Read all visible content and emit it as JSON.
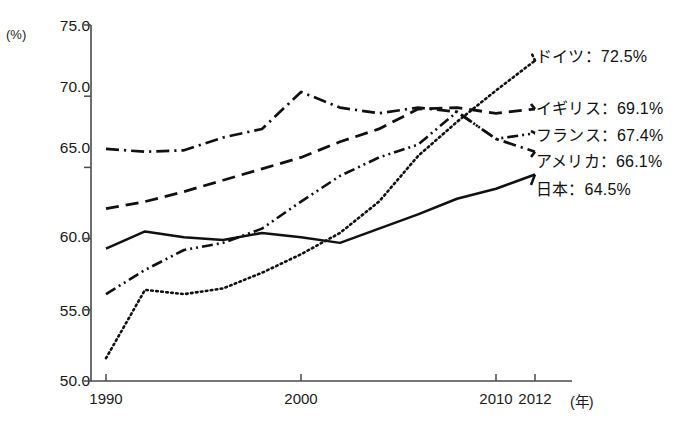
{
  "chart_data": {
    "type": "line",
    "title": "",
    "subtitle": "",
    "xlabel": "(年)",
    "ylabel": "(%)",
    "xlim": [
      1990,
      2012
    ],
    "ylim": [
      50.0,
      75.0
    ],
    "grid": false,
    "legend_position": "right-inline-end-of-line",
    "x_tick_labels": [
      "1990",
      "2000",
      "2010",
      "2012"
    ],
    "x_ticks": [
      1990,
      2000,
      2010,
      2012
    ],
    "y_tick_labels": [
      "75.0",
      "70.0",
      "65.0",
      "60.0",
      "55.0",
      "50.0"
    ],
    "y_ticks": [
      75.0,
      70.0,
      65.0,
      60.0,
      55.0,
      50.0
    ],
    "x": [
      1990,
      1992,
      1994,
      1996,
      1998,
      2000,
      2002,
      2004,
      2006,
      2008,
      2010,
      2012
    ],
    "series": [
      {
        "name": "ドイツ",
        "label": "ドイツ：72.5%",
        "end_value": 72.5,
        "style": "dotted",
        "values": [
          51.6,
          56.4,
          56.1,
          56.5,
          57.6,
          58.9,
          60.4,
          62.6,
          65.8,
          68.2,
          70.4,
          72.5
        ]
      },
      {
        "name": "イギリス",
        "label": "イギリス：69.1%",
        "end_value": 69.1,
        "style": "dashed",
        "values": [
          62.1,
          62.6,
          63.3,
          64.1,
          64.9,
          65.7,
          66.8,
          67.7,
          69.1,
          69.2,
          68.8,
          69.1
        ]
      },
      {
        "name": "フランス",
        "label": "フランス：67.4%",
        "end_value": 67.4,
        "style": "dash-dot-dot",
        "values": [
          56.1,
          57.8,
          59.2,
          59.7,
          60.7,
          62.6,
          64.4,
          65.7,
          66.6,
          68.9,
          67.0,
          67.4
        ]
      },
      {
        "name": "アメリカ",
        "label": "アメリカ：66.1%",
        "end_value": 66.1,
        "style": "dash-dot",
        "values": [
          66.3,
          66.1,
          66.2,
          67.1,
          67.7,
          70.3,
          69.2,
          68.8,
          69.2,
          68.9,
          67.0,
          66.1
        ]
      },
      {
        "name": "日本",
        "label": "日本：64.5%",
        "end_value": 64.5,
        "style": "solid",
        "values": [
          59.3,
          60.5,
          60.1,
          59.9,
          60.4,
          60.1,
          59.7,
          60.7,
          61.7,
          62.8,
          63.5,
          64.5
        ]
      }
    ]
  },
  "axis": {
    "y_unit": "(%)",
    "x_unit": "(年)"
  }
}
